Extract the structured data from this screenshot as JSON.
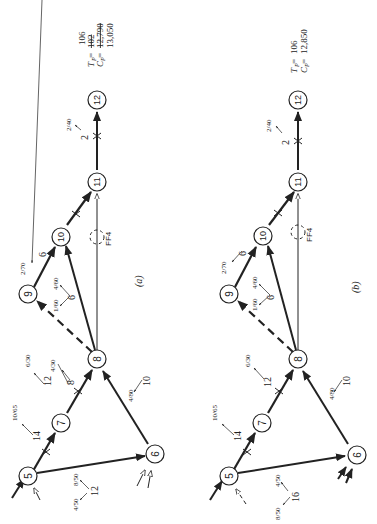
{
  "diagrams": [
    {
      "id": "a",
      "caption": "(a)",
      "nodes": [
        "5",
        "6",
        "7",
        "8",
        "9",
        "10",
        "11",
        "12"
      ],
      "labels": {
        "e57_dur": "14",
        "e57_cost": "10/65",
        "e78_dur": "12",
        "e78_cost": "6/30",
        "e78_dur2": "8",
        "e78_cost2": "4/30",
        "e56_dur": "12",
        "e56_cost1": "8/50",
        "e56_cost2": "4/50",
        "e68_dur": "10",
        "e68_cost": "4/80",
        "e810_dur": "6",
        "e89_cost": "1/60",
        "e810_cost": "4/60",
        "e910_dur": "6",
        "e910_cost": "2/70",
        "e1112_dur": "2",
        "e1112_cost": "2/40",
        "ff": "FF4"
      },
      "summary": {
        "tp_label": "T",
        "tp_sub": "P",
        "tp_old": "102",
        "tp_new": "106",
        "cp_label": "C",
        "cp_sub": "P",
        "cp_old": "12,790",
        "cp_new": "13,050"
      }
    },
    {
      "id": "b",
      "caption": "(b)",
      "nodes": [
        "5",
        "6",
        "7",
        "8",
        "9",
        "10",
        "11",
        "12"
      ],
      "labels": {
        "e57_dur": "14",
        "e57_cost": "10/65",
        "e78_dur": "12",
        "e78_cost": "6/30",
        "e56_dur": "16",
        "e56_cost1": "4/50",
        "e56_cost2": "8/50",
        "e68_dur": "10",
        "e68_cost": "4/80",
        "e810_dur": "6",
        "e89_cost": "1/60",
        "e810_cost": "4/60",
        "e910_dur": "6",
        "e910_cost": "2/70",
        "e1112_dur": "2",
        "e1112_cost": "2/40",
        "ff": "FF4"
      },
      "summary": {
        "tp_label": "T",
        "tp_sub": "P",
        "tp_value": "106",
        "cp_label": "C",
        "cp_sub": "P",
        "cp_value": "12,850"
      }
    }
  ]
}
